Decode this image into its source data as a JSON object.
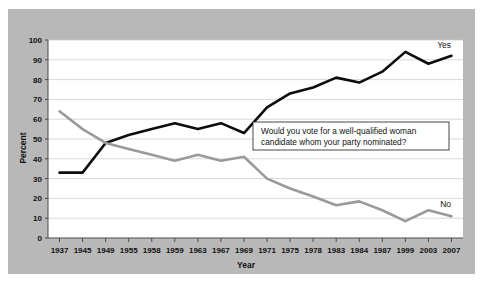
{
  "chart_data": {
    "type": "line",
    "title": "",
    "xlabel": "Year",
    "ylabel": "Percent",
    "ylim": [
      0,
      100
    ],
    "ytick_step": 10,
    "yticks": [
      0,
      10,
      20,
      30,
      40,
      50,
      60,
      70,
      80,
      90,
      100
    ],
    "grid": true,
    "legend_position": "inline-right-end",
    "categories": [
      "1937",
      "1945",
      "1949",
      "1955",
      "1958",
      "1959",
      "1963",
      "1967",
      "1969",
      "1971",
      "1975",
      "1978",
      "1983",
      "1984",
      "1987",
      "1999",
      "2003",
      "2007"
    ],
    "series": [
      {
        "name": "Yes",
        "color": "#0d0d0d",
        "values": [
          33,
          33,
          48,
          52,
          55,
          58,
          55,
          58,
          53,
          66,
          73,
          76,
          81,
          78.5,
          84,
          94,
          88,
          92
        ]
      },
      {
        "name": "No",
        "color": "#9a9a9a",
        "values": [
          64,
          55,
          48,
          45,
          42,
          39,
          42,
          39,
          41,
          30,
          25,
          21,
          16.5,
          18.5,
          14,
          8.5,
          14,
          11
        ]
      }
    ],
    "annotations": [
      {
        "name": "survey-question",
        "line1": "Would you vote for a well-qualified woman",
        "line2": "candidate whom your party nominated?"
      }
    ]
  },
  "labels": {
    "yes_label": "Yes",
    "no_label": "No"
  }
}
